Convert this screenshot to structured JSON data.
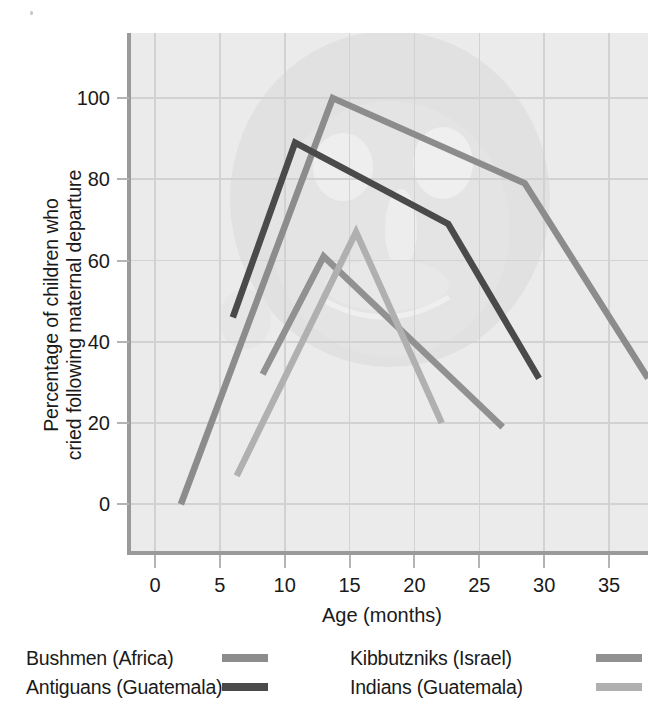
{
  "chart_data": {
    "type": "line",
    "title": "",
    "xlabel": "Age (months)",
    "ylabel": "Percentage of children who cried following maternal departure",
    "ylabel_line1": "Percentage of children who",
    "ylabel_line2": "cried following maternal departure",
    "xlim": [
      -2,
      38
    ],
    "ylim": [
      -12,
      116
    ],
    "xticks": [
      0,
      5,
      10,
      15,
      20,
      25,
      30,
      35
    ],
    "xticklabels": [
      "0",
      "5",
      "10",
      "15",
      "20",
      "25",
      "30",
      "35"
    ],
    "yticks": [
      0,
      20,
      40,
      60,
      80,
      100
    ],
    "yticklabels": [
      "0",
      "20",
      "40",
      "60",
      "80",
      "100"
    ],
    "grid": true,
    "legend_position": "below",
    "series": [
      {
        "name": "Bushmen (Africa)",
        "color": "#8c8c8c",
        "points": [
          {
            "x": 2.0,
            "y": 0
          },
          {
            "x": 13.7,
            "y": 100
          },
          {
            "x": 28.5,
            "y": 79
          },
          {
            "x": 38.0,
            "y": 31
          }
        ]
      },
      {
        "name": "Antiguans (Guatemala)",
        "color": "#4a4a4a",
        "points": [
          {
            "x": 6.0,
            "y": 46
          },
          {
            "x": 10.8,
            "y": 89
          },
          {
            "x": 22.6,
            "y": 69
          },
          {
            "x": 29.6,
            "y": 31
          }
        ]
      },
      {
        "name": "Kibbutzniks (Israel)",
        "color": "#919191",
        "points": [
          {
            "x": 8.3,
            "y": 32
          },
          {
            "x": 13.0,
            "y": 61
          },
          {
            "x": 26.8,
            "y": 19
          }
        ]
      },
      {
        "name": "Indians (Guatemala)",
        "color": "#b0b0b0",
        "points": [
          {
            "x": 6.3,
            "y": 7
          },
          {
            "x": 15.5,
            "y": 67
          },
          {
            "x": 22.1,
            "y": 20
          }
        ]
      }
    ]
  },
  "legend": {
    "entries": [
      {
        "label": "Bushmen (Africa)",
        "color": "#8c8c8c"
      },
      {
        "label": "Antiguans (Guatemala)",
        "color": "#4a4a4a"
      },
      {
        "label": "Kibbutzniks (Israel)",
        "color": "#919191"
      },
      {
        "label": "Indians (Guatemala)",
        "color": "#b0b0b0"
      }
    ]
  },
  "style": {
    "plot_background": "#ebebeb",
    "grid_color": "#d2d2d2",
    "axis_color": "#9a9a9a",
    "text_color": "#1a1a1a",
    "watermark_color": "#e0e0e0"
  }
}
